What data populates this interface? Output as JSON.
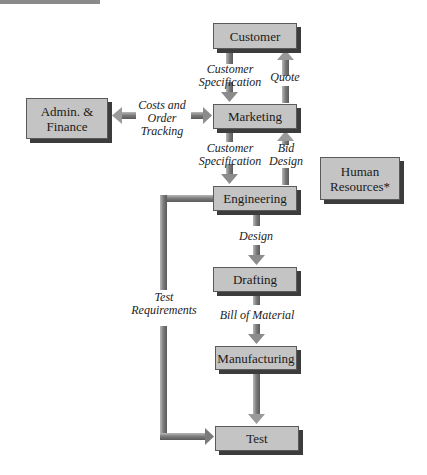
{
  "diagram": {
    "type": "flowchart",
    "nodes": {
      "customer": "Customer",
      "marketing": "Marketing",
      "admin_line1": "Admin. &",
      "admin_line2": "Finance",
      "engineering": "Engineering",
      "hr_line1": "Human",
      "hr_line2": "Resources*",
      "drafting": "Drafting",
      "manufacturing": "Manufacturing",
      "test": "Test"
    },
    "edges": {
      "cust_spec_1_line1": "Customer",
      "cust_spec_1_line2": "Specification",
      "quote": "Quote",
      "costs_line1": "Costs and",
      "costs_line2": "Order",
      "costs_line3": "Tracking",
      "cust_spec_2_line1": "Customer",
      "cust_spec_2_line2": "Specification",
      "bid_line1": "Bid",
      "bid_line2": "Design",
      "design": "Design",
      "bill_of_material": "Bill of Material",
      "test_req_line1": "Test",
      "test_req_line2": "Requirements"
    },
    "colors": {
      "box_fill": "#c4c4c4",
      "box_shadow": "#3c3c3c",
      "arrow": "#8c8c8c"
    }
  }
}
